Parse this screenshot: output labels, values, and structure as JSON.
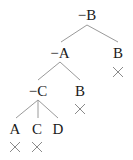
{
  "diagram": {
    "type": "tableau-tree",
    "nodes": [
      {
        "id": "root",
        "label": "−B",
        "x": 87,
        "y": 15
      },
      {
        "id": "n1",
        "label": "−A",
        "x": 60,
        "y": 53
      },
      {
        "id": "n2",
        "label": "B",
        "x": 118,
        "y": 53,
        "closed": true
      },
      {
        "id": "n3",
        "label": "−C",
        "x": 38,
        "y": 91
      },
      {
        "id": "n4",
        "label": "B",
        "x": 80,
        "y": 91,
        "closed": true
      },
      {
        "id": "n5",
        "label": "A",
        "x": 15,
        "y": 129,
        "closed": true
      },
      {
        "id": "n6",
        "label": "C",
        "x": 37,
        "y": 129,
        "closed": true
      },
      {
        "id": "n7",
        "label": "D",
        "x": 58,
        "y": 129,
        "closed": false
      }
    ],
    "edges": [
      [
        "root",
        "n1"
      ],
      [
        "root",
        "n2"
      ],
      [
        "n1",
        "n3"
      ],
      [
        "n1",
        "n4"
      ],
      [
        "n3",
        "n5"
      ],
      [
        "n3",
        "n6"
      ],
      [
        "n3",
        "n7"
      ]
    ],
    "closed_marker": "×"
  }
}
